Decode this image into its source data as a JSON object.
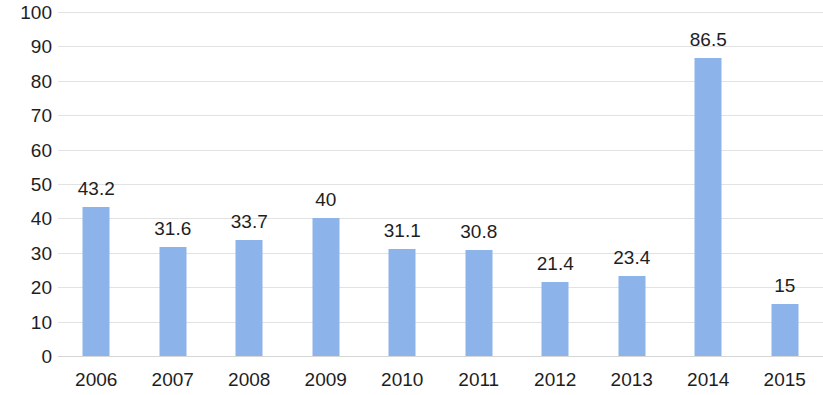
{
  "chart_data": {
    "type": "bar",
    "title": "",
    "subtitle": "",
    "xlabel": "",
    "ylabel": "",
    "categories": [
      "2006",
      "2007",
      "2008",
      "2009",
      "2010",
      "2011",
      "2012",
      "2013",
      "2014",
      "2015"
    ],
    "values": [
      43.2,
      31.6,
      33.7,
      40,
      31.1,
      30.8,
      21.4,
      23.4,
      86.5,
      15
    ],
    "data_labels": [
      "43.2",
      "31.6",
      "33.7",
      "40",
      "31.1",
      "30.8",
      "21.4",
      "23.4",
      "86.5",
      "15"
    ],
    "ylim": [
      0,
      100
    ],
    "ytick_values": [
      0,
      10,
      20,
      30,
      40,
      50,
      60,
      70,
      80,
      90,
      100
    ],
    "ytick_labels": [
      "0",
      "10",
      "20",
      "30",
      "40",
      "50",
      "60",
      "70",
      "80",
      "90",
      "100"
    ],
    "grid": true,
    "grid_axis": "y",
    "legend": false,
    "legend_position": "none",
    "bar_color": "#8cb4ea",
    "grid_color": "#e2e2e2",
    "text_color": "#1e1e1e",
    "background_color": "#ffffff"
  }
}
